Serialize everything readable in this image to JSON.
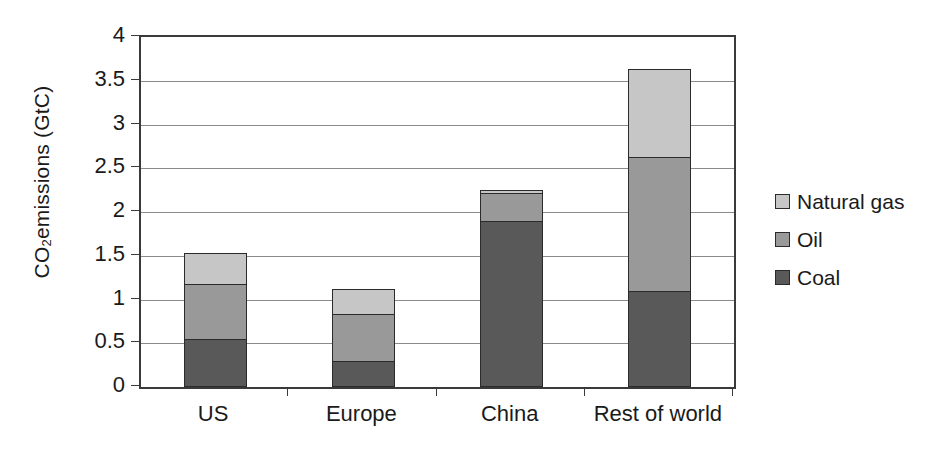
{
  "chart_data": {
    "type": "bar",
    "subtype": "stacked-vertical",
    "title": "",
    "xlabel": "",
    "ylabel": "CO2 emissions  (GtC)",
    "ylabel_display": "CO",
    "ylabel_sub": "2",
    "ylabel_rest": " emissions  (GtC)",
    "categories": [
      "US",
      "Europe",
      "China",
      "Rest of world"
    ],
    "series": [
      {
        "name": "Coal",
        "color": "#595959",
        "values": [
          0.55,
          0.3,
          1.9,
          1.1
        ]
      },
      {
        "name": "Oil",
        "color": "#999999",
        "values": [
          0.63,
          0.53,
          0.32,
          1.53
        ]
      },
      {
        "name": "Natural gas",
        "color": "#c6c6c6",
        "values": [
          0.35,
          0.29,
          0.03,
          1.0
        ]
      }
    ],
    "stack_order_bottom_to_top": [
      "Coal",
      "Oil",
      "Natural gas"
    ],
    "totals": [
      1.53,
      1.12,
      2.25,
      3.63
    ],
    "ylim": [
      0,
      4
    ],
    "ytick_values": [
      0,
      0.5,
      1,
      1.5,
      2,
      2.5,
      3,
      3.5,
      4
    ],
    "ytick_labels": [
      "0",
      "0.5",
      "1",
      "1.5",
      "2",
      "2.5",
      "3",
      "3.5",
      "4"
    ],
    "grid": "horizontal",
    "legend_position": "right",
    "legend_entries": [
      {
        "label": "Natural gas",
        "color": "#c6c6c6"
      },
      {
        "label": "Oil",
        "color": "#999999"
      },
      {
        "label": "Coal",
        "color": "#595959"
      }
    ],
    "axis_color": "#3a3a3a",
    "gridline_color": "#8a8a8a",
    "background": "#ffffff"
  }
}
